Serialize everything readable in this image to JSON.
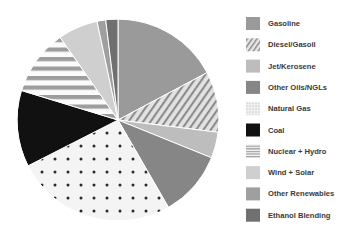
{
  "chart_data": {
    "type": "pie",
    "title": "",
    "subtitle": "",
    "xlabel": "",
    "ylabel": "",
    "grid": false,
    "legend_position": "right",
    "start_angle_deg": 0,
    "direction": "clockwise",
    "center_px": [
      118,
      120
    ],
    "radius_px": 101,
    "categories": [
      "Gasoline",
      "Diesel/Gasoil",
      "Jet/Kerosene",
      "Other Oils/NGLs",
      "Natural Gas",
      "Coal",
      "Nuclear + Hydro",
      "Wind + Solar",
      "Other Renewables",
      "Ethanol Blending"
    ],
    "values": [
      17.2,
      9.7,
      4.2,
      10.6,
      25.8,
      12.2,
      10.6,
      6.4,
      1.4,
      1.9
    ],
    "value_unit": "percent",
    "slices": [
      {
        "label": "Gasoline",
        "value": 17.2,
        "start_deg": 0.0,
        "end_deg": 62.0,
        "fill": "#9a9a9a",
        "pattern": "solid"
      },
      {
        "label": "Diesel/Gasoil",
        "value": 9.7,
        "start_deg": 62.0,
        "end_deg": 97.0,
        "fill": "#d8d8d8",
        "pattern": "diagonal-hatch"
      },
      {
        "label": "Jet/Kerosene",
        "value": 4.2,
        "start_deg": 97.0,
        "end_deg": 112.0,
        "fill": "#bdbdbd",
        "pattern": "solid"
      },
      {
        "label": "Other Oils/NGLs",
        "value": 10.6,
        "start_deg": 112.0,
        "end_deg": 150.0,
        "fill": "#868686",
        "pattern": "solid"
      },
      {
        "label": "Natural Gas",
        "value": 25.8,
        "start_deg": 150.0,
        "end_deg": 243.0,
        "fill": "#f2f2f2",
        "pattern": "dots"
      },
      {
        "label": "Coal",
        "value": 12.2,
        "start_deg": 243.0,
        "end_deg": 287.0,
        "fill": "#111111",
        "pattern": "solid"
      },
      {
        "label": "Nuclear + Hydro",
        "value": 10.6,
        "start_deg": 287.0,
        "end_deg": 325.0,
        "fill": "#fafafa",
        "pattern": "horizontal-stripes"
      },
      {
        "label": "Wind + Solar",
        "value": 6.4,
        "start_deg": 325.0,
        "end_deg": 348.0,
        "fill": "#cfcfcf",
        "pattern": "solid"
      },
      {
        "label": "Other Renewables",
        "value": 1.4,
        "start_deg": 348.0,
        "end_deg": 353.0,
        "fill": "#9f9f9f",
        "pattern": "solid"
      },
      {
        "label": "Ethanol Blending",
        "value": 1.9,
        "start_deg": 353.0,
        "end_deg": 360.0,
        "fill": "#707070",
        "pattern": "solid"
      }
    ]
  },
  "legend": {
    "items": [
      {
        "label": "Gasoline",
        "swatch": "swatch-solid-gray",
        "fill": "#9a9a9a",
        "pattern": "solid"
      },
      {
        "label": "Diesel/Gasoil",
        "swatch": "swatch-diagonal-hatch",
        "fill": "#d8d8d8",
        "pattern": "diagonal-hatch"
      },
      {
        "label": "Jet/Kerosene",
        "swatch": "swatch-solid-light-gray",
        "fill": "#bdbdbd",
        "pattern": "solid"
      },
      {
        "label": "Other Oils/NGLs",
        "swatch": "swatch-solid-dark-gray",
        "fill": "#868686",
        "pattern": "solid"
      },
      {
        "label": "Natural Gas",
        "swatch": "swatch-dots",
        "fill": "#f2f2f2",
        "pattern": "dots"
      },
      {
        "label": "Coal",
        "swatch": "swatch-solid-black",
        "fill": "#111111",
        "pattern": "solid"
      },
      {
        "label": "Nuclear + Hydro",
        "swatch": "swatch-horizontal-stripes",
        "fill": "#fafafa",
        "pattern": "horizontal-stripes"
      },
      {
        "label": "Wind + Solar",
        "swatch": "swatch-solid-pale-gray",
        "fill": "#cfcfcf",
        "pattern": "solid"
      },
      {
        "label": "Other Renewables",
        "swatch": "swatch-solid-mid-gray",
        "fill": "#9f9f9f",
        "pattern": "solid"
      },
      {
        "label": "Ethanol Blending",
        "swatch": "swatch-solid-charcoal",
        "fill": "#707070",
        "pattern": "solid"
      }
    ]
  },
  "colors": {
    "background": "#ffffff",
    "text": "#3a3a3a",
    "outline": "#ffffff"
  }
}
